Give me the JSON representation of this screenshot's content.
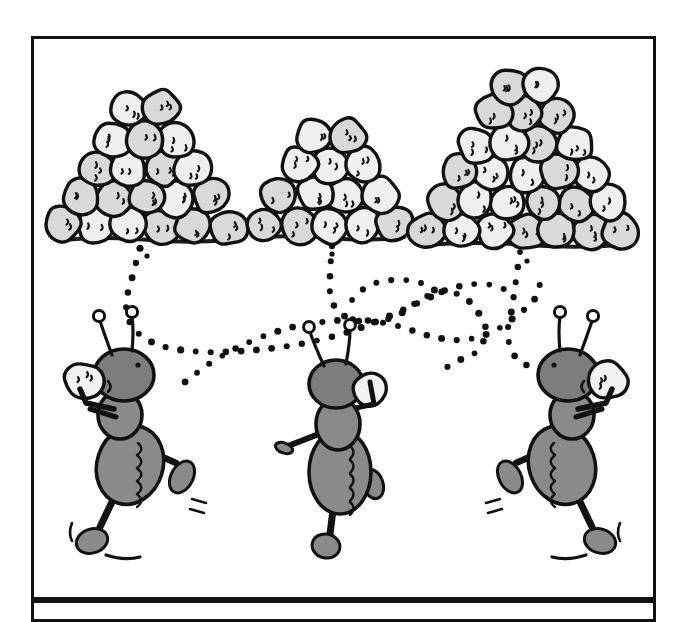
{
  "image": {
    "kind": "cartoon-illustration",
    "title": "Ants carrying pebbles to piles",
    "width": 688,
    "height": 622,
    "background_color": "#ffffff",
    "ink_color": "#111111",
    "pebble_fill": "#d9d9d9",
    "pebble_fill_light": "#efefef",
    "ant_body_fill": "#8a8a8a",
    "ant_body_shade": "#6e6e6e",
    "ant_head_fill": "#7d7d7d",
    "carried_pebble_fill": "#f2f2f2",
    "ground_color": "#1a1a1a",
    "trail_dot_color": "#111111"
  },
  "panels": [
    {
      "name": "main-panel",
      "x": 31,
      "y": 36,
      "width": 625,
      "height": 564,
      "border_color": "#111111",
      "border_width": 3,
      "fill": "#ffffff"
    },
    {
      "name": "lower-panel",
      "x": 31,
      "y": 600,
      "width": 625,
      "height": 22,
      "border_color": "#111111",
      "border_width": 3,
      "fill": "#ffffff"
    }
  ],
  "pebble_piles": [
    {
      "name": "pile-left",
      "label": "medium pile",
      "center_x": 145,
      "base_y": 238,
      "rows": 5,
      "base_count": 6,
      "pebble_radius": 19,
      "total_pebbles": 19,
      "ground_x1": 62,
      "ground_x2": 238,
      "ground_y": 238
    },
    {
      "name": "pile-middle",
      "label": "small pile",
      "center_x": 330,
      "base_y": 236,
      "rows": 4,
      "base_count": 5,
      "pebble_radius": 19,
      "total_pebbles": 13,
      "ground_x1": 258,
      "ground_x2": 404,
      "ground_y": 236
    },
    {
      "name": "pile-right",
      "label": "large pile",
      "center_x": 525,
      "base_y": 243,
      "rows": 6,
      "base_count": 7,
      "pebble_radius": 19,
      "total_pebbles": 27,
      "ground_x1": 424,
      "ground_x2": 632,
      "ground_y": 243
    }
  ],
  "ants": [
    {
      "name": "ant-left",
      "label": "ant walking right carrying pebble",
      "x": 130,
      "y": 465,
      "facing": "right",
      "carrying_pebble": true,
      "antennae": 2,
      "legs": 3
    },
    {
      "name": "ant-middle",
      "label": "ant seen from behind carrying pebble",
      "x": 340,
      "y": 470,
      "facing": "away",
      "carrying_pebble": true,
      "antennae": 2,
      "legs": 3
    },
    {
      "name": "ant-right",
      "label": "ant walking left carrying pebble",
      "x": 562,
      "y": 465,
      "facing": "left",
      "carrying_pebble": true,
      "antennae": 2,
      "legs": 3
    }
  ],
  "trails": [
    {
      "name": "trail-left-pile-to-left-ant",
      "description": "dotted path curving from left pile down and right toward middle",
      "dot_radius": 3.2,
      "dot_spacing": 15
    },
    {
      "name": "trail-middle-pile-to-middle-ant",
      "description": "dotted path from middle pile curving down and right",
      "dot_radius": 3.2,
      "dot_spacing": 15
    },
    {
      "name": "trail-right-pile-to-right-ant",
      "description": "dotted path from right pile looping down to right ant",
      "dot_radius": 3.2,
      "dot_spacing": 15
    },
    {
      "name": "trail-crossing-long",
      "description": "long dotted path crossing from left ant area to right side",
      "dot_radius": 3.2,
      "dot_spacing": 15
    }
  ]
}
